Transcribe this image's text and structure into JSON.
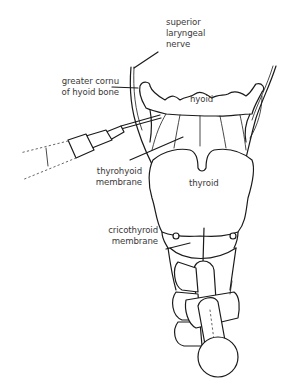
{
  "diagram": {
    "type": "anatomical-illustration",
    "labels": {
      "superior_laryngeal_nerve": {
        "line1": "superior",
        "line2": "laryngeal",
        "line3": "nerve"
      },
      "greater_cornu": {
        "line1": "greater cornu",
        "line2": "of hyoid bone"
      },
      "hyoid": {
        "text": "hyoid"
      },
      "thyrohyoid_membrane": {
        "line1": "thyrohyoid",
        "line2": "membrane"
      },
      "thyroid": {
        "text": "thyroid"
      },
      "cricothyroid_membrane": {
        "line1": "cricothyroid",
        "line2": "membrane"
      }
    },
    "elements": [
      "superior-laryngeal-nerve",
      "hyoid-bone",
      "greater-cornu",
      "thyrohyoid-membrane",
      "thyroid-cartilage",
      "cricothyroid-membrane",
      "cricoid-cartilage",
      "tracheal-rings",
      "left-syringe-needle",
      "bottom-syringe-transtracheal"
    ],
    "colors": {
      "line": "#1a1a1a",
      "text": "#3a3a3a",
      "background": "#ffffff"
    }
  }
}
